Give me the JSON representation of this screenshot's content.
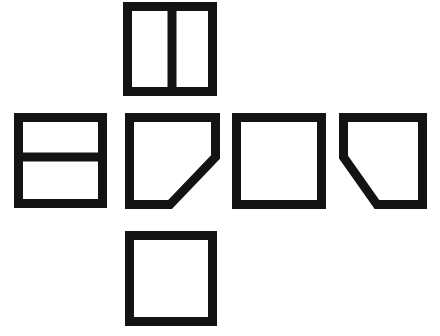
{
  "figure": {
    "background_color": "#ffffff",
    "stroke_color": "#131313",
    "stroke_width": 9,
    "canvas": {
      "width": 440,
      "height": 336
    },
    "layout": "cross",
    "panel_count": 6,
    "panels": [
      {
        "id": "panel-top",
        "name": "top-square-split-vertical",
        "label": "Square divided by a vertical line",
        "shape": "square",
        "marking": "vertical-divider",
        "position": {
          "x": 123,
          "y": 2,
          "width": 94,
          "height": 94
        },
        "outline_points": "4.5,4.5 89.5,4.5 89.5,89.5 4.5,89.5",
        "divider": {
          "x1": 49,
          "y1": 4.5,
          "x2": 49,
          "y2": 89.5
        }
      },
      {
        "id": "panel-left",
        "name": "left-square-split-horizontal",
        "label": "Square divided by a horizontal line",
        "shape": "square",
        "marking": "horizontal-divider",
        "position": {
          "x": 14,
          "y": 113,
          "width": 93,
          "height": 95
        },
        "outline_points": "4.5,4.5 88.5,4.5 88.5,90.5 4.5,90.5",
        "divider": {
          "x1": 4.5,
          "y1": 44,
          "x2": 88.5,
          "y2": 44
        }
      },
      {
        "id": "panel-center",
        "name": "center-square-corner-cut-bottom-right",
        "label": "Square with bottom-right corner cut off",
        "shape": "pentagon",
        "marking": "diagonal-bottom-right",
        "position": {
          "x": 125,
          "y": 113,
          "width": 95,
          "height": 96
        },
        "outline_points": "4.5,4.5 90.5,4.5 90.5,44 45,91.5 4.5,91.5",
        "divider": null
      },
      {
        "id": "panel-right-inner",
        "name": "right-inner-square-blank",
        "label": "Plain empty square",
        "shape": "square",
        "marking": "none",
        "position": {
          "x": 232,
          "y": 113,
          "width": 94,
          "height": 96
        },
        "outline_points": "4.5,4.5 89.5,4.5 89.5,91.5 4.5,91.5",
        "divider": null
      },
      {
        "id": "panel-right-outer",
        "name": "right-outer-square-corner-cut-bottom-left",
        "label": "Square with bottom-left corner cut off",
        "shape": "pentagon",
        "marking": "diagonal-bottom-left",
        "position": {
          "x": 339,
          "y": 113,
          "width": 88,
          "height": 96
        },
        "outline_points": "4.5,4.5 83.5,4.5 83.5,91.5 38,91.5 4.5,44",
        "divider": null
      },
      {
        "id": "panel-bottom",
        "name": "bottom-square-blank",
        "label": "Plain empty square",
        "shape": "square",
        "marking": "none",
        "position": {
          "x": 125,
          "y": 231,
          "width": 92,
          "height": 95
        },
        "outline_points": "4.5,4.5 87.5,4.5 87.5,90.5 4.5,90.5",
        "divider": null
      }
    ]
  }
}
